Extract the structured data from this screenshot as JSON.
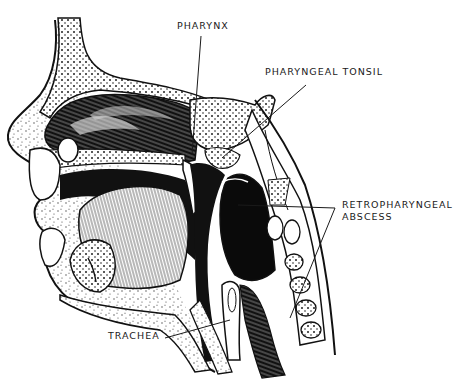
{
  "figure": {
    "colors": {
      "ink": "#111111",
      "paper": "#ffffff",
      "label": "#1a1a1a"
    }
  },
  "labels": {
    "pharynx": "PHARYNX",
    "pharyngeal_tonsil": "PHARYNGEAL TONSIL",
    "retropharyngeal_line1": "RETROPHARYNGEAL",
    "retropharyngeal_line2": "ABSCESS",
    "trachea": "TRACHEA"
  }
}
